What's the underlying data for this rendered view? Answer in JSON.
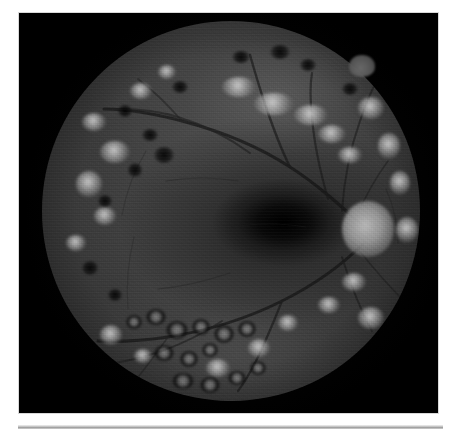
{
  "figure": {
    "kind": "retinal-fundus-photograph",
    "modality": "monochrome fundus photography",
    "caption": "",
    "background_color": "#ffffff",
    "photo_background_color": "#000000",
    "photo_frame": {
      "x": 19,
      "y": 13,
      "width": 419,
      "height": 400
    },
    "fundus_circle": {
      "center_x": 230,
      "center_y": 211,
      "radius": 189
    }
  },
  "image_content": {
    "eye_laterality": "left",
    "field_description": "Posterior pole with optic disc at temporal right, macula at centre, and dense peripheral scarring",
    "landmarks": [
      {
        "name": "optic-disc",
        "label": "Optic disc",
        "x": 0.855,
        "y": 0.545,
        "brightness": "#9c9c9c"
      },
      {
        "name": "macula",
        "label": "Macula / fovea",
        "x": 0.64,
        "y": 0.53,
        "brightness": "#141414"
      },
      {
        "name": "rim-bump",
        "label": "Superior rim protrusion",
        "x": 0.905,
        "y": 0.14,
        "brightness": "#5c5c5c"
      }
    ],
    "findings": [
      "Scattered pale retinal lesions (exudates / laser photocoagulation scars) in the superior and nasal periphery",
      "Dark round pigmented burns in the inferior periphery",
      "Prominent vascular arcades emerging from the optic disc",
      "Dark fovea with surrounding grey-toned posterior pole"
    ]
  },
  "palette": {
    "page_white": "#ffffff",
    "photo_black": "#000000",
    "retina_mid_gray": "#3e3e3e",
    "macula_dark": "#141414",
    "disc_bright": "#9c9c9c",
    "rule_gray": "#a8a8a8"
  },
  "bottom_rule": {
    "x": 18,
    "y": 425,
    "width": 425,
    "height": 4,
    "color": "#a8a8a8"
  }
}
